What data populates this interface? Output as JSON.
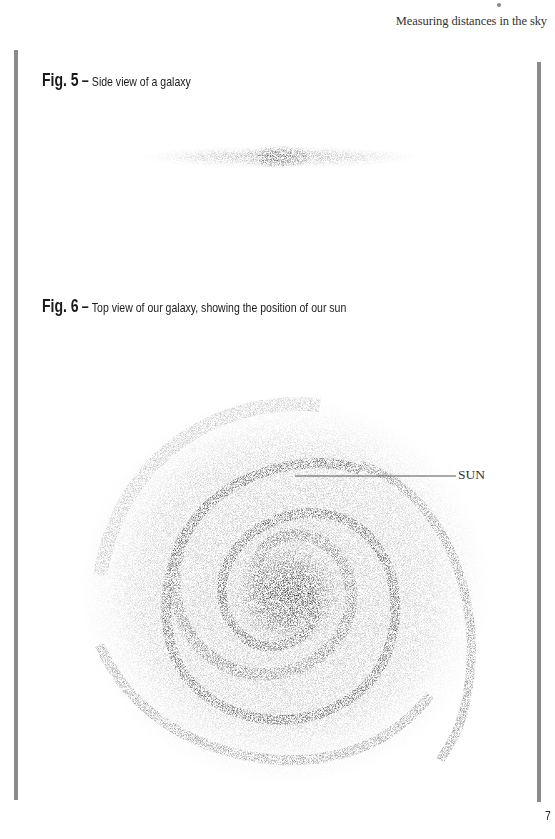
{
  "header": {
    "running_title": "Measuring distances in the sky"
  },
  "figures": [
    {
      "number_label": "Fig. 5",
      "separator": "–",
      "description": "Side view of a galaxy",
      "illustration": "edge-on-galaxy"
    },
    {
      "number_label": "Fig. 6",
      "separator": "–",
      "description": "Top view of our galaxy, showing the position of our sun",
      "illustration": "spiral-galaxy-top-view",
      "annotations": [
        {
          "label": "SUN"
        }
      ]
    }
  ],
  "footer": {
    "page_number": "7"
  },
  "colors": {
    "rule_bars": "#8a8a8a",
    "text": "#1a1a1a",
    "stipple": "#3a3a3a"
  }
}
